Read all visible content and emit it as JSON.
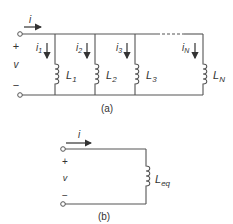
{
  "figure_a": {
    "caption": "(a)",
    "current_label": "i",
    "plus": "+",
    "voltage": "v",
    "minus": "−",
    "branches": [
      {
        "current": "i",
        "current_sub": "1",
        "inductor": "L",
        "inductor_sub": "1"
      },
      {
        "current": "i",
        "current_sub": "2",
        "inductor": "L",
        "inductor_sub": "2"
      },
      {
        "current": "i",
        "current_sub": "3",
        "inductor": "L",
        "inductor_sub": "3"
      },
      {
        "current": "i",
        "current_sub": "N",
        "inductor": "L",
        "inductor_sub": "N"
      }
    ]
  },
  "figure_b": {
    "caption": "(b)",
    "current_label": "i",
    "plus": "+",
    "voltage": "v",
    "minus": "−",
    "inductor": "L",
    "inductor_sub": "eq"
  }
}
